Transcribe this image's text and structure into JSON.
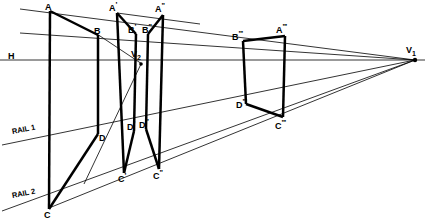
{
  "figure": {
    "width": 425,
    "height": 219,
    "background": "#ffffff",
    "stroke_color": "#000000"
  },
  "vanishing_points": [
    {
      "id": "v1",
      "label": "V",
      "sub": "1",
      "x": 415,
      "y": 60,
      "label_x": 409,
      "label_y": 48
    },
    {
      "id": "v2",
      "label": "V",
      "sub": "2",
      "x": 141,
      "y": 63,
      "label_x": 132,
      "label_y": 52
    }
  ],
  "guides": {
    "horizon": {
      "name": "H",
      "label": "H",
      "label_x": 9,
      "label_y": 53,
      "y": 60,
      "x1": 0,
      "x2": 425
    },
    "rail1": {
      "label": "RAIL 1",
      "label_x": 12,
      "label_y": 130,
      "x1": 2,
      "y1": 145,
      "x2": 415,
      "y2": 60
    },
    "rail2": {
      "label": "RAIL 2",
      "label_x": 12,
      "label_y": 193,
      "x1": 2,
      "y1": 211,
      "x2": 415,
      "y2": 60
    },
    "top_guide": {
      "x1": 20,
      "y1": 9,
      "x2": 415,
      "y2": 60
    },
    "second_guide": {
      "x1": 20,
      "y1": 33,
      "x2": 415,
      "y2": 60
    }
  },
  "points": [
    {
      "id": "A",
      "label": "A",
      "primes": "",
      "x": 50,
      "y": 11,
      "label_x": 45,
      "label_y": 1
    },
    {
      "id": "B",
      "label": "B",
      "primes": "",
      "x": 98,
      "y": 35,
      "label_x": 96,
      "label_y": 25
    },
    {
      "id": "Ap",
      "label": "A",
      "primes": "'",
      "x": 117,
      "y": 13,
      "label_x": 110,
      "label_y": 2
    },
    {
      "id": "Bp",
      "label": "B",
      "primes": "'",
      "x": 136,
      "y": 34,
      "label_x": 129,
      "label_y": 24
    },
    {
      "id": "Bpp",
      "label": "B",
      "primes": "''",
      "x": 148,
      "y": 34,
      "label_x": 142,
      "label_y": 24
    },
    {
      "id": "App",
      "label": "A",
      "primes": "''",
      "x": 163,
      "y": 15,
      "label_x": 156,
      "label_y": 3
    },
    {
      "id": "Bppp",
      "label": "B",
      "primes": "'''",
      "x": 243,
      "y": 41,
      "label_x": 233,
      "label_y": 31
    },
    {
      "id": "Appp",
      "label": "A",
      "primes": "'''",
      "x": 285,
      "y": 36,
      "label_x": 277,
      "label_y": 24
    },
    {
      "id": "C",
      "label": "C",
      "primes": "",
      "x": 49,
      "y": 208,
      "label_x": 46,
      "label_y": 209
    },
    {
      "id": "D",
      "label": "D",
      "primes": "",
      "x": 98,
      "y": 133,
      "label_x": 98,
      "label_y": 133
    },
    {
      "id": "Cp",
      "label": "C",
      "primes": "'",
      "x": 124,
      "y": 172,
      "label_x": 119,
      "label_y": 174
    },
    {
      "id": "Dp",
      "label": "D",
      "primes": "'",
      "x": 134,
      "y": 130,
      "label_x": 128,
      "label_y": 122
    },
    {
      "id": "Dpp",
      "label": "D",
      "primes": "''",
      "x": 146,
      "y": 128,
      "label_x": 140,
      "label_y": 120
    },
    {
      "id": "Cpp",
      "label": "C",
      "primes": "''",
      "x": 159,
      "y": 168,
      "label_x": 154,
      "label_y": 170
    },
    {
      "id": "Dppp",
      "label": "D",
      "primes": "'''",
      "x": 246,
      "y": 103,
      "label_x": 237,
      "label_y": 100
    },
    {
      "id": "Cppp",
      "label": "C",
      "primes": "'''",
      "x": 283,
      "y": 116,
      "label_x": 277,
      "label_y": 121
    }
  ],
  "strokes": {
    "thin_width": 0.8,
    "heavy_width": 2.4,
    "medium_width": 1.6
  },
  "edges_heavy": [
    {
      "name": "edge-A-C",
      "x1": 50,
      "y1": 11,
      "x2": 49,
      "y2": 208
    },
    {
      "name": "edge-A-B",
      "x1": 50,
      "y1": 11,
      "x2": 98,
      "y2": 35
    },
    {
      "name": "edge-C-D",
      "x1": 49,
      "y1": 208,
      "x2": 98,
      "y2": 133
    },
    {
      "name": "edge-B-D",
      "x1": 98,
      "y1": 35,
      "x2": 98,
      "y2": 133
    },
    {
      "name": "edge-Ap-Cp",
      "x1": 117,
      "y1": 13,
      "x2": 124,
      "y2": 172
    },
    {
      "name": "edge-Ap-Bp",
      "x1": 117,
      "y1": 13,
      "x2": 136,
      "y2": 34
    },
    {
      "name": "edge-Bp-Dp",
      "x1": 136,
      "y1": 34,
      "x2": 134,
      "y2": 130
    },
    {
      "name": "edge-Dp-Cp",
      "x1": 134,
      "y1": 130,
      "x2": 124,
      "y2": 172
    },
    {
      "name": "edge-App-Cpp",
      "x1": 163,
      "y1": 15,
      "x2": 159,
      "y2": 168
    },
    {
      "name": "edge-App-Bpp",
      "x1": 163,
      "y1": 15,
      "x2": 148,
      "y2": 34
    },
    {
      "name": "edge-Bpp-Dpp",
      "x1": 148,
      "y1": 34,
      "x2": 146,
      "y2": 128
    },
    {
      "name": "edge-Dpp-Cpp",
      "x1": 146,
      "y1": 128,
      "x2": 159,
      "y2": 168
    },
    {
      "name": "edge-Appp-Cppp",
      "x1": 285,
      "y1": 36,
      "x2": 283,
      "y2": 116
    },
    {
      "name": "edge-Appp-Bppp",
      "x1": 285,
      "y1": 36,
      "x2": 243,
      "y2": 41
    },
    {
      "name": "edge-Bppp-Dppp",
      "x1": 243,
      "y1": 41,
      "x2": 246,
      "y2": 103
    },
    {
      "name": "edge-Dppp-Cppp",
      "x1": 246,
      "y1": 103,
      "x2": 283,
      "y2": 116
    }
  ],
  "edges_thin": [
    {
      "name": "construction-C-V1",
      "x1": 49,
      "y1": 208,
      "x2": 415,
      "y2": 60
    },
    {
      "name": "construction-D-V1",
      "x1": 20,
      "y1": 145,
      "x2": 415,
      "y2": 60
    },
    {
      "name": "construction-A-V1",
      "x1": 20,
      "y1": 9,
      "x2": 415,
      "y2": 60
    },
    {
      "name": "construction-B-V1",
      "x1": 20,
      "y1": 33,
      "x2": 415,
      "y2": 60
    },
    {
      "name": "construction-horizon",
      "x1": 0,
      "y1": 60,
      "x2": 425,
      "y2": 60
    },
    {
      "name": "diagonal-B-V2",
      "x1": 98,
      "y1": 35,
      "x2": 141,
      "y2": 63
    },
    {
      "name": "diagonal-V2-C",
      "x1": 141,
      "y1": 63,
      "x2": 85,
      "y2": 180
    },
    {
      "name": "diagonal-D-V2",
      "x1": 98,
      "y1": 133,
      "x2": 141,
      "y2": 63
    },
    {
      "name": "measure-Ap-App-ext",
      "x1": 117,
      "y1": 13,
      "x2": 175,
      "y2": 20
    },
    {
      "name": "top-rail-Cpp-Cppp",
      "x1": 159,
      "y1": 168,
      "x2": 415,
      "y2": 60
    }
  ]
}
